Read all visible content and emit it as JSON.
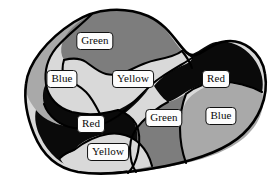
{
  "figure": {
    "kind": "map-coloring-diagram",
    "width": 279,
    "height": 193,
    "background": "#ffffff",
    "outline_color": "#000000"
  },
  "palette": {
    "red": "#0a0a0a",
    "green": "#7d7d7d",
    "blue": "#a9a9a9",
    "yellow": "#d9d9d9",
    "label_fill": "#fdfdfd",
    "label_border": "#111111"
  },
  "regions": [
    {
      "id": "region-green-top",
      "label": "Green",
      "fill": "#7d7d7d",
      "label_x": 95,
      "label_y": 41
    },
    {
      "id": "region-blue-left",
      "label": "Blue",
      "fill": "#a9a9a9",
      "label_x": 62,
      "label_y": 79
    },
    {
      "id": "region-yellow-center",
      "label": "Yellow",
      "fill": "#d9d9d9",
      "label_x": 133,
      "label_y": 79
    },
    {
      "id": "region-red-right",
      "label": "Red",
      "fill": "#0a0a0a",
      "label_x": 216,
      "label_y": 79
    },
    {
      "id": "region-green-center",
      "label": "Green",
      "fill": "#7d7d7d",
      "label_x": 164,
      "label_y": 118
    },
    {
      "id": "region-blue-right",
      "label": "Blue",
      "fill": "#a9a9a9",
      "label_x": 221,
      "label_y": 116
    },
    {
      "id": "region-red-left",
      "label": "Red",
      "fill": "#0a0a0a",
      "label_x": 91,
      "label_y": 124
    },
    {
      "id": "region-yellow-bottom",
      "label": "Yellow",
      "fill": "#d9d9d9",
      "label_x": 108,
      "label_y": 152
    }
  ]
}
